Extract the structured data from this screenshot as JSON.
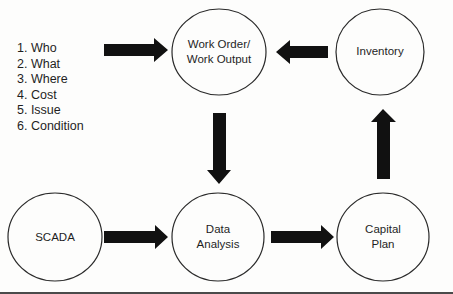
{
  "diagram": {
    "checklist": {
      "items": [
        "1. Who",
        "2. What",
        "3. Where",
        "4. Cost",
        "5. Issue",
        "6. Condition"
      ]
    },
    "nodes": {
      "work_order": {
        "line1": "Work Order/",
        "line2": "Work Output"
      },
      "inventory": {
        "label": "Inventory"
      },
      "scada": {
        "label": "SCADA"
      },
      "data_analysis": {
        "line1": "Data",
        "line2": "Analysis"
      },
      "capital_plan": {
        "line1": "Capital",
        "line2": "Plan"
      }
    },
    "edges": [
      {
        "from": "checklist",
        "to": "work_order",
        "direction": "right"
      },
      {
        "from": "inventory",
        "to": "work_order",
        "direction": "left"
      },
      {
        "from": "work_order",
        "to": "data_analysis",
        "direction": "down"
      },
      {
        "from": "scada",
        "to": "data_analysis",
        "direction": "right"
      },
      {
        "from": "data_analysis",
        "to": "capital_plan",
        "direction": "right"
      },
      {
        "from": "capital_plan",
        "to": "inventory",
        "direction": "up"
      }
    ],
    "colors": {
      "arrow": "#111111",
      "circle_stroke": "#2a2a2a",
      "background": "#fdfdfc"
    }
  }
}
